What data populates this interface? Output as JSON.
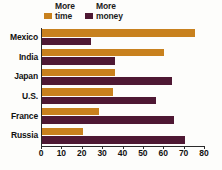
{
  "chart_data": {
    "type": "bar",
    "orientation": "horizontal",
    "title": "",
    "subtitle": "",
    "xlabel": "",
    "ylabel": "",
    "categories": [
      "Mexico",
      "India",
      "Japan",
      "U.S.",
      "France",
      "Russia"
    ],
    "series": [
      {
        "name": "More time",
        "legend_line1": "More",
        "legend_line2": "time",
        "color": "#c8811e",
        "values": [
          75,
          60,
          36,
          35,
          28,
          20
        ]
      },
      {
        "name": "More money",
        "legend_line1": "More",
        "legend_line2": "money",
        "color": "#4e1833",
        "values": [
          24,
          36,
          64,
          56,
          65,
          70
        ]
      }
    ],
    "xlim": [
      0,
      80
    ],
    "xticks": [
      0,
      10,
      20,
      30,
      40,
      50,
      60,
      70,
      80
    ],
    "xtick_labels": [
      "0",
      "10",
      "20",
      "30",
      "40",
      "50",
      "60",
      "70",
      "80"
    ],
    "grid": false,
    "legend_position": "top-left"
  },
  "colors": {
    "time_orange": "#c8811e",
    "money_maroon": "#4e1833",
    "axis": "#2a2a2a",
    "text": "#111111",
    "background": "#fdfdfb"
  }
}
